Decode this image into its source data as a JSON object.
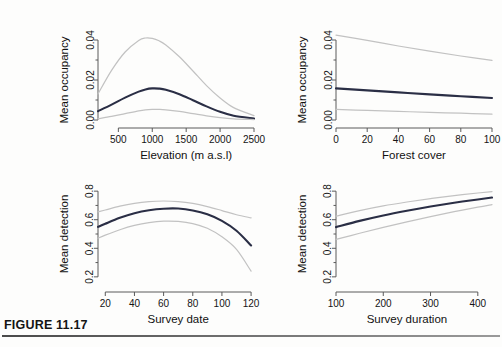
{
  "figure": {
    "caption_label": "FIGURE 11.17",
    "caption_subtext": ""
  },
  "style": {
    "estimate_color": "#2b2f४4",
    "estimate_color_hex": "#2a2e45",
    "ci_color_hex": "#c2c2c2",
    "axis_color_hex": "#5a5a5a",
    "background_hex": "#fdfdfc"
  },
  "panels": [
    {
      "id": "occupancy-elevation",
      "ylabel": "Mean occupancy",
      "xlabel": "Elevation (m a.s.l)",
      "xticks": [
        "500",
        "1000",
        "1500",
        "2000",
        "2500"
      ],
      "yticks": [
        "0.00",
        "0.02",
        "0.04"
      ]
    },
    {
      "id": "occupancy-forest",
      "ylabel": "Mean occupancy",
      "xlabel": "Forest cover",
      "xticks": [
        "0",
        "20",
        "40",
        "60",
        "80",
        "100"
      ],
      "yticks": [
        "0.00",
        "0.02",
        "0.04"
      ]
    },
    {
      "id": "detection-date",
      "ylabel": "Mean detection",
      "xlabel": "Survey date",
      "xticks": [
        "20",
        "40",
        "60",
        "80",
        "100",
        "120"
      ],
      "yticks": [
        "0.2",
        "0.4",
        "0.6",
        "0.8"
      ]
    },
    {
      "id": "detection-duration",
      "ylabel": "Mean detection",
      "xlabel": "Survey duration",
      "xticks": [
        "100",
        "200",
        "300",
        "400"
      ],
      "yticks": [
        "0.2",
        "0.4",
        "0.6",
        "0.8"
      ]
    }
  ],
  "chart_data": [
    {
      "type": "line",
      "id": "occupancy-elevation",
      "title": "",
      "xlabel": "Elevation (m a.s.l)",
      "ylabel": "Mean occupancy",
      "xlim": [
        200,
        2500
      ],
      "ylim": [
        0.0,
        0.05
      ],
      "xticks": [
        500,
        1000,
        1500,
        2000,
        2500
      ],
      "yticks": [
        0.0,
        0.02,
        0.04
      ],
      "grid": false,
      "legend": "none",
      "x": [
        200,
        400,
        600,
        800,
        900,
        1000,
        1100,
        1200,
        1400,
        1600,
        1800,
        2000,
        2200,
        2500
      ],
      "series": [
        {
          "name": "Upper 95% CI",
          "role": "ci-upper",
          "values": [
            0.013,
            0.0248,
            0.034,
            0.0398,
            0.041,
            0.0408,
            0.0396,
            0.0375,
            0.0316,
            0.0245,
            0.0172,
            0.011,
            0.0062,
            0.0022
          ]
        },
        {
          "name": "Mean occupancy estimate",
          "role": "estimate",
          "values": [
            0.0044,
            0.0077,
            0.0112,
            0.0142,
            0.0153,
            0.0158,
            0.0157,
            0.0151,
            0.0129,
            0.0099,
            0.0068,
            0.0041,
            0.0021,
            0.0007
          ]
        },
        {
          "name": "Lower 95% CI",
          "role": "ci-lower",
          "values": [
            0.0006,
            0.0018,
            0.0032,
            0.0046,
            0.0051,
            0.0053,
            0.0053,
            0.0051,
            0.0043,
            0.0032,
            0.0021,
            0.0012,
            0.0006,
            0.0002
          ]
        }
      ]
    },
    {
      "type": "line",
      "id": "occupancy-forest",
      "title": "",
      "xlabel": "Forest cover",
      "ylabel": "Mean occupancy",
      "xlim": [
        0,
        100
      ],
      "ylim": [
        0.0,
        0.05
      ],
      "xticks": [
        0,
        20,
        40,
        60,
        80,
        100
      ],
      "yticks": [
        0.0,
        0.02,
        0.04
      ],
      "grid": false,
      "legend": "none",
      "x": [
        0,
        20,
        40,
        60,
        80,
        100
      ],
      "series": [
        {
          "name": "Upper 95% CI",
          "role": "ci-upper",
          "values": [
            0.0424,
            0.0398,
            0.037,
            0.0344,
            0.032,
            0.0298
          ]
        },
        {
          "name": "Mean occupancy estimate",
          "role": "estimate",
          "values": [
            0.0158,
            0.0148,
            0.0138,
            0.0128,
            0.0119,
            0.011
          ]
        },
        {
          "name": "Lower 95% CI",
          "role": "ci-lower",
          "values": [
            0.0053,
            0.0048,
            0.0043,
            0.0038,
            0.0034,
            0.0029
          ]
        }
      ]
    },
    {
      "type": "line",
      "id": "detection-date",
      "title": "",
      "xlabel": "Survey date",
      "ylabel": "Mean detection",
      "xlim": [
        15,
        122
      ],
      "ylim": [
        0.15,
        0.85
      ],
      "xticks": [
        20,
        40,
        60,
        80,
        100,
        120
      ],
      "yticks": [
        0.2,
        0.4,
        0.6,
        0.8
      ],
      "grid": false,
      "legend": "none",
      "x": [
        15,
        20,
        30,
        40,
        50,
        60,
        70,
        80,
        90,
        100,
        110,
        120
      ],
      "series": [
        {
          "name": "Upper 95% CI",
          "role": "ci-upper",
          "values": [
            0.655,
            0.668,
            0.695,
            0.715,
            0.727,
            0.731,
            0.727,
            0.714,
            0.692,
            0.664,
            0.635,
            0.613
          ]
        },
        {
          "name": "Mean detection estimate",
          "role": "estimate",
          "values": [
            0.55,
            0.572,
            0.613,
            0.645,
            0.666,
            0.677,
            0.678,
            0.665,
            0.638,
            0.592,
            0.523,
            0.42
          ]
        },
        {
          "name": "Lower 95% CI",
          "role": "ci-lower",
          "values": [
            0.47,
            0.492,
            0.53,
            0.56,
            0.58,
            0.59,
            0.588,
            0.573,
            0.54,
            0.48,
            0.392,
            0.24
          ]
        }
      ]
    },
    {
      "type": "line",
      "id": "detection-duration",
      "title": "",
      "xlabel": "Survey duration",
      "ylabel": "Mean detection",
      "xlim": [
        100,
        430
      ],
      "ylim": [
        0.15,
        0.85
      ],
      "xticks": [
        100,
        200,
        300,
        400
      ],
      "yticks": [
        0.2,
        0.4,
        0.6,
        0.8
      ],
      "grid": false,
      "legend": "none",
      "x": [
        100,
        150,
        200,
        250,
        300,
        350,
        400,
        430
      ],
      "series": [
        {
          "name": "Upper 95% CI",
          "role": "ci-upper",
          "values": [
            0.625,
            0.664,
            0.697,
            0.724,
            0.748,
            0.769,
            0.787,
            0.797
          ]
        },
        {
          "name": "Mean detection estimate",
          "role": "estimate",
          "values": [
            0.548,
            0.592,
            0.63,
            0.663,
            0.693,
            0.719,
            0.742,
            0.755
          ]
        },
        {
          "name": "Lower 95% CI",
          "role": "ci-lower",
          "values": [
            0.462,
            0.505,
            0.546,
            0.585,
            0.622,
            0.656,
            0.688,
            0.706
          ]
        }
      ]
    }
  ]
}
